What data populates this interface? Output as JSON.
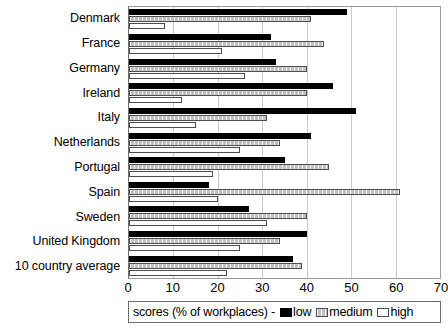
{
  "chart_data": {
    "type": "bar",
    "orientation": "horizontal",
    "title": "",
    "xlabel": "scores (% of workplaces)",
    "ylabel": "",
    "xlim": [
      0,
      70
    ],
    "xticks": [
      0,
      10,
      20,
      30,
      40,
      50,
      60,
      70
    ],
    "grid": true,
    "legend_position": "bottom",
    "categories": [
      "Denmark",
      "France",
      "Germany",
      "Ireland",
      "Italy",
      "Netherlands",
      "Portugal",
      "Spain",
      "Sweden",
      "United Kingdom",
      "10 country average"
    ],
    "series": [
      {
        "name": "low",
        "color": "#000000",
        "values": [
          49,
          32,
          33,
          46,
          51,
          41,
          35,
          18,
          27,
          40,
          37
        ]
      },
      {
        "name": "medium",
        "color": "#c0c0c0",
        "values": [
          41,
          44,
          40,
          40,
          31,
          34,
          45,
          61,
          40,
          34,
          39
        ]
      },
      {
        "name": "high",
        "color": "#ffffff",
        "values": [
          8,
          21,
          26,
          12,
          15,
          25,
          19,
          20,
          31,
          25,
          22
        ]
      }
    ]
  },
  "legend": {
    "title": "scores (% of workplaces) -",
    "entries": [
      {
        "label": "low",
        "swatch": "swatch-low"
      },
      {
        "label": "medium",
        "swatch": "swatch-medium"
      },
      {
        "label": "high",
        "swatch": "swatch-high"
      }
    ]
  }
}
